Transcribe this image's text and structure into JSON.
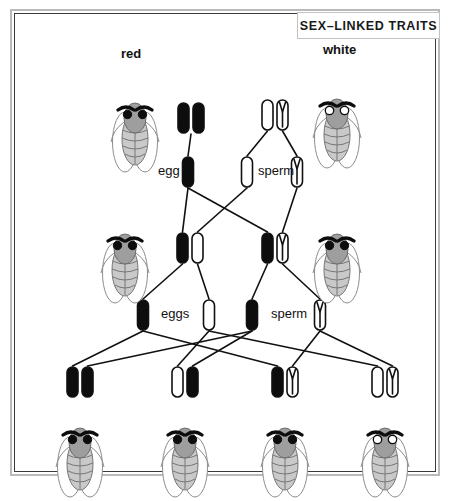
{
  "title": "SEX–LINKED TRAITS",
  "caption": "",
  "colors": {
    "allele_red_fill": "#0d0d0d",
    "allele_white_fill": "#ffffff",
    "chromosome_outline": "#111111",
    "fly_body": "#a0a0a0",
    "fly_wing": "#ffffff",
    "fly_outline": "#555555",
    "line": "#111111",
    "frame_outer": "#b9b9b9",
    "frame_inner": "#3a3a3a"
  },
  "legend": {
    "x_red_name": "X chromosome carrying red-eye allele",
    "x_white_name": "X chromosome carrying white-eye allele",
    "y_name": "Y chromosome"
  },
  "generations": [
    {
      "name": "parental",
      "label": "P",
      "flies": [
        {
          "id": "p-mother",
          "phenotype_label": "red",
          "eye_style": "filled",
          "sex": "female",
          "x": 135,
          "y": 112
        },
        {
          "id": "p-father",
          "phenotype_label": "white",
          "eye_style": "hollow",
          "sex": "male",
          "x": 337,
          "y": 108
        }
      ],
      "genotypes": [
        {
          "id": "p-mother-genotype",
          "alleles": [
            "X-red",
            "X-red"
          ],
          "x": 191,
          "y": 118
        },
        {
          "id": "p-father-genotype",
          "alleles": [
            "X-white",
            "Y"
          ],
          "x": 275,
          "y": 115
        }
      ],
      "gametes": [
        {
          "id": "p-egg",
          "label": "egg",
          "label_x": 158,
          "label_y": 163,
          "alleles": [
            "X-red"
          ],
          "x": 188,
          "y": 172
        },
        {
          "id": "p-sperm-x",
          "label": "",
          "alleles": [
            "X-white"
          ],
          "x": 247,
          "y": 172
        },
        {
          "id": "p-sperm-y",
          "label": "sperm",
          "label_x": 258,
          "label_y": 163,
          "alleles": [
            "Y"
          ],
          "x": 297,
          "y": 172
        }
      ]
    },
    {
      "name": "f1",
      "label": "F1",
      "flies": [
        {
          "id": "f1-daughter",
          "phenotype_label": "",
          "eye_style": "filled",
          "sex": "female",
          "x": 125,
          "y": 243
        },
        {
          "id": "f1-son",
          "phenotype_label": "",
          "eye_style": "filled",
          "sex": "male",
          "x": 337,
          "y": 243
        }
      ],
      "genotypes": [
        {
          "id": "f1-daughter-genotype",
          "alleles": [
            "X-red",
            "X-white"
          ],
          "x": 190,
          "y": 248
        },
        {
          "id": "f1-son-genotype",
          "alleles": [
            "X-red",
            "Y"
          ],
          "x": 275,
          "y": 248
        }
      ],
      "gametes": [
        {
          "id": "f1-egg-red",
          "label": "eggs",
          "label_x": 161,
          "label_y": 306,
          "alleles": [
            "X-red"
          ],
          "x": 143,
          "y": 315
        },
        {
          "id": "f1-egg-white",
          "label": "",
          "alleles": [
            "X-white"
          ],
          "x": 209,
          "y": 315
        },
        {
          "id": "f1-sperm-x",
          "label": "sperm",
          "label_x": 271,
          "label_y": 306,
          "alleles": [
            "X-red"
          ],
          "x": 252,
          "y": 315
        },
        {
          "id": "f1-sperm-y",
          "label": "",
          "alleles": [
            "Y"
          ],
          "x": 320,
          "y": 315
        }
      ]
    },
    {
      "name": "f2",
      "label": "F2",
      "flies": [
        {
          "id": "f2-child-1",
          "phenotype_label": "",
          "eye_style": "filled",
          "sex": "female",
          "x": 80,
          "y": 437
        },
        {
          "id": "f2-child-2",
          "phenotype_label": "",
          "eye_style": "filled",
          "sex": "female",
          "x": 185,
          "y": 437
        },
        {
          "id": "f2-child-3",
          "phenotype_label": "",
          "eye_style": "filled",
          "sex": "male",
          "x": 285,
          "y": 437
        },
        {
          "id": "f2-child-4",
          "phenotype_label": "",
          "eye_style": "hollow",
          "sex": "male",
          "x": 385,
          "y": 437
        }
      ],
      "genotypes": [
        {
          "id": "f2-child-1-genotype",
          "alleles": [
            "X-red",
            "X-red"
          ],
          "x": 80,
          "y": 382
        },
        {
          "id": "f2-child-2-genotype",
          "alleles": [
            "X-white",
            "X-red"
          ],
          "x": 185,
          "y": 382
        },
        {
          "id": "f2-child-3-genotype",
          "alleles": [
            "X-red",
            "Y"
          ],
          "x": 285,
          "y": 382
        },
        {
          "id": "f2-child-4-genotype",
          "alleles": [
            "X-white",
            "Y"
          ],
          "x": 385,
          "y": 382
        }
      ]
    }
  ]
}
